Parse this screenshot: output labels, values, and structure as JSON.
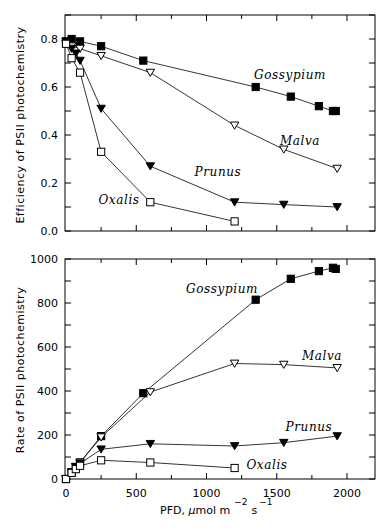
{
  "chart_data": [
    {
      "type": "line",
      "title": "",
      "xlabel": "PFD, µmol m^-2 s^-1",
      "ylabel": "Efficiency of PSII photochemistry",
      "xlim": [
        0,
        2200
      ],
      "ylim": [
        0,
        0.9
      ],
      "xticks": [
        0,
        500,
        1000,
        1500,
        2000
      ],
      "yticks": [
        "0.0",
        "0.2",
        "0.4",
        "0.6",
        "0.8"
      ],
      "grid": false,
      "series": [
        {
          "name": "Gossypium",
          "marker": "filled-square",
          "x": [
            0,
            40,
            100,
            250,
            550,
            1350,
            1600,
            1800,
            1900,
            1920
          ],
          "y": [
            0.79,
            0.8,
            0.79,
            0.77,
            0.71,
            0.6,
            0.56,
            0.52,
            0.5,
            0.5
          ]
        },
        {
          "name": "Malva",
          "marker": "open-triangle-down",
          "x": [
            0,
            40,
            100,
            250,
            600,
            1200,
            1550,
            1930
          ],
          "y": [
            0.78,
            0.77,
            0.76,
            0.73,
            0.66,
            0.44,
            0.34,
            0.26
          ]
        },
        {
          "name": "Prunus",
          "marker": "filled-triangle-down",
          "x": [
            0,
            40,
            70,
            100,
            250,
            600,
            1200,
            1550,
            1930
          ],
          "y": [
            0.79,
            0.76,
            0.74,
            0.71,
            0.51,
            0.27,
            0.12,
            0.11,
            0.1
          ]
        },
        {
          "name": "Oxalis",
          "marker": "open-square",
          "x": [
            0,
            40,
            100,
            250,
            600,
            1200
          ],
          "y": [
            0.78,
            0.72,
            0.66,
            0.33,
            0.12,
            0.04
          ]
        }
      ]
    },
    {
      "type": "line",
      "title": "",
      "xlabel": "PFD, µmol m^-2 s^-1",
      "ylabel": "Rate of PSII photochemistry",
      "xlim": [
        0,
        2200
      ],
      "ylim": [
        0,
        1000
      ],
      "xticks": [
        0,
        500,
        1000,
        1500,
        2000
      ],
      "yticks": [
        0,
        200,
        400,
        600,
        800,
        1000
      ],
      "grid": false,
      "series": [
        {
          "name": "Gossypium",
          "marker": "filled-square",
          "x": [
            0,
            40,
            70,
            100,
            250,
            550,
            1350,
            1600,
            1800,
            1900,
            1920
          ],
          "y": [
            0,
            30,
            55,
            75,
            195,
            390,
            815,
            910,
            945,
            960,
            955
          ]
        },
        {
          "name": "Malva",
          "marker": "open-triangle-down",
          "x": [
            0,
            40,
            70,
            100,
            250,
            600,
            1200,
            1550,
            1930
          ],
          "y": [
            0,
            30,
            55,
            75,
            190,
            395,
            525,
            520,
            505
          ]
        },
        {
          "name": "Prunus",
          "marker": "filled-triangle-down",
          "x": [
            0,
            40,
            70,
            100,
            250,
            600,
            1200,
            1550,
            1930
          ],
          "y": [
            0,
            30,
            55,
            70,
            135,
            160,
            150,
            165,
            195
          ]
        },
        {
          "name": "Oxalis",
          "marker": "open-square",
          "x": [
            0,
            40,
            70,
            100,
            250,
            600,
            1200
          ],
          "y": [
            0,
            28,
            45,
            60,
            85,
            75,
            50
          ]
        }
      ]
    }
  ],
  "labels": {
    "top_ylabel": "Efficiency of PSII photochemistry",
    "bottom_ylabel": "Rate of PSII photochemistry",
    "xlabel_main": "PFD, ",
    "xlabel_mu": "µ",
    "xlabel_unit": "mol m",
    "xlabel_exp1": "−2",
    "xlabel_s": "s",
    "xlabel_exp2": "−1",
    "species_top": {
      "gossypium": "Gossypium",
      "malva": "Malva",
      "prunus": "Prunus",
      "oxalis": "Oxalis"
    },
    "species_bottom": {
      "gossypium": "Gossypium",
      "malva": "Malva",
      "prunus": "Prunus",
      "oxalis": "Oxalis"
    }
  },
  "ticks": {
    "top_y": [
      "0.0",
      "0.2",
      "0.4",
      "0.6",
      "0.8"
    ],
    "bottom_y": [
      "0",
      "200",
      "400",
      "600",
      "800",
      "1000"
    ],
    "x": [
      "0",
      "500",
      "1000",
      "1500",
      "2000"
    ]
  }
}
